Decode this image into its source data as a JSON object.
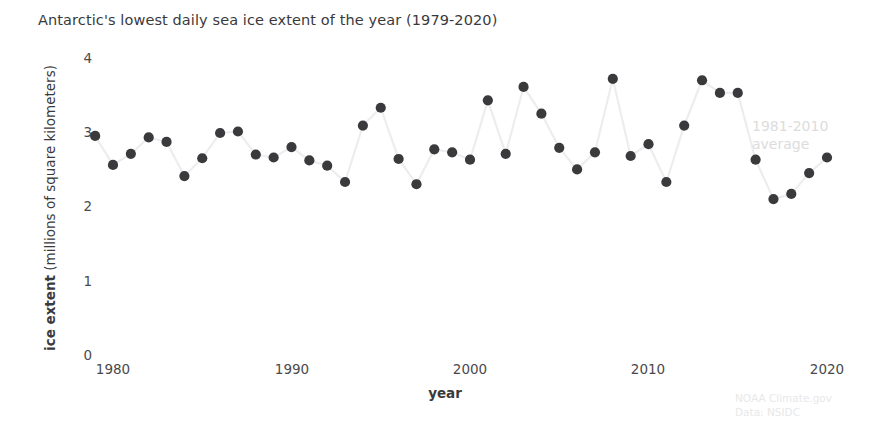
{
  "title": "Antarctic's lowest daily sea ice extent of the year (1979-2020)",
  "axis": {
    "xlabel": "year",
    "ylabel_bold": "ice extent",
    "ylabel_rest": " (millions of square kilometers)"
  },
  "annotations": {
    "average_line1": "1981-2010",
    "average_line2": "average",
    "credit_line1": "NOAA Climate.gov",
    "credit_line2": "Data: NSIDC"
  },
  "colors": {
    "marker": "#3a3a3c",
    "line": "#ededef",
    "text": "#3a3a3c",
    "annotation": "#dcdcdc",
    "credit": "#e8e8e8",
    "background": "#ffffff"
  },
  "chart_data": {
    "type": "line",
    "title": "Antarctic's lowest daily sea ice extent of the year (1979-2020)",
    "xlabel": "year",
    "ylabel": "ice extent (millions of square kilometers)",
    "xlim": [
      1978.2,
      1921.0
    ],
    "x_range": [
      1978.2,
      2021.0
    ],
    "ylim": [
      0,
      4.15
    ],
    "grid": false,
    "legend": null,
    "marker": "circle",
    "xticks": [
      1980,
      1990,
      2000,
      2010,
      2020
    ],
    "yticks": [
      0,
      1,
      2,
      3,
      4
    ],
    "x": [
      1979,
      1980,
      1981,
      1982,
      1983,
      1984,
      1985,
      1986,
      1987,
      1988,
      1989,
      1990,
      1991,
      1992,
      1993,
      1994,
      1995,
      1996,
      1997,
      1998,
      1999,
      2000,
      2001,
      2002,
      2003,
      2004,
      2005,
      2006,
      2007,
      2008,
      2009,
      2010,
      2011,
      2012,
      2013,
      2014,
      2015,
      2016,
      2017,
      2018,
      2019,
      2020
    ],
    "values": [
      2.95,
      2.56,
      2.71,
      2.93,
      2.87,
      2.41,
      2.65,
      2.99,
      3.01,
      2.7,
      2.66,
      2.8,
      2.62,
      2.55,
      2.33,
      3.09,
      3.33,
      2.64,
      2.3,
      2.77,
      2.73,
      2.63,
      3.43,
      2.71,
      3.61,
      3.25,
      2.79,
      2.5,
      2.73,
      3.72,
      2.68,
      2.84,
      2.33,
      3.09,
      3.7,
      3.53,
      3.53,
      2.63,
      2.1,
      2.17,
      2.45,
      2.66
    ],
    "annotations": [
      {
        "text": "1981-2010 average",
        "x": 2017.5,
        "y": 2.97
      }
    ],
    "source": "NOAA Climate.gov / Data: NSIDC"
  }
}
